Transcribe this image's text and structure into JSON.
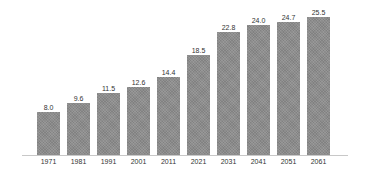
{
  "chart_data": {
    "type": "bar",
    "title": "",
    "xlabel": "",
    "ylabel": "",
    "categories": [
      "1971",
      "1981",
      "1991",
      "2001",
      "2011",
      "2021",
      "2031",
      "2041",
      "2051",
      "2061"
    ],
    "values": [
      8.0,
      9.6,
      11.5,
      12.6,
      14.4,
      18.5,
      22.8,
      24.0,
      24.7,
      25.5
    ],
    "value_labels": [
      "8.0",
      "9.6",
      "11.5",
      "12.6",
      "14.4",
      "18.5",
      "22.8",
      "24.0",
      "24.7",
      "25.5"
    ],
    "ylim": [
      0,
      27
    ],
    "grid": false,
    "legend": null,
    "bar_color": "#8c8c8c",
    "data_labels_on_bars": true
  }
}
